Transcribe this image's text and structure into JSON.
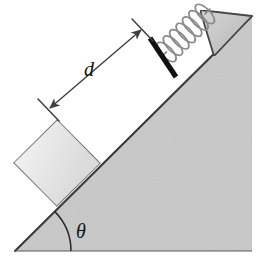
{
  "figure": {
    "type": "physics-diagram",
    "width": 269,
    "height": 268,
    "background_color": "#ffffff"
  },
  "labels": {
    "distance_label": "d",
    "angle_label": "θ"
  },
  "colors": {
    "incline_fill": "#c9c9c9",
    "incline_stroke": "#3a3a3a",
    "block_fill": "#e9e9e9",
    "block_stroke": "#555555",
    "wall_fill": "#c4c4c4",
    "wall_stroke": "#3a3a3a",
    "spring_stroke": "#7a7a7a",
    "plate_fill": "#111111",
    "dimension_stroke": "#3f3f3f",
    "arc_stroke": "#2a2a2a",
    "text_color": "#111111"
  },
  "elements": {
    "incline": {
      "name": "inclined-plane",
      "description": "Right triangle wedge, hypotenuse rising left to right",
      "apex_point": [
        15,
        251
      ],
      "top_right_point": [
        252,
        16
      ],
      "bottom_right_point": [
        252,
        251
      ]
    },
    "block": {
      "name": "block",
      "description": "Square block resting on the incline surface",
      "center": [
        57,
        163
      ],
      "size": 62
    },
    "spring": {
      "name": "spring",
      "description": "Coiled compression spring along the incline",
      "coils": 7,
      "start": [
        172,
        62
      ],
      "end": [
        224,
        24
      ]
    },
    "plate": {
      "name": "spring-end-plate",
      "description": "Thick black bar perpendicular to incline at the free end of the spring",
      "from": [
        149,
        38
      ],
      "to": [
        176,
        76
      ]
    },
    "wall": {
      "name": "spring-anchor-wall",
      "description": "Narrow triangular flange at the top of the incline anchoring the spring",
      "tip": [
        200,
        10
      ],
      "base_outer": [
        252,
        16
      ],
      "base_inner": [
        215,
        55
      ]
    },
    "dimension": {
      "name": "distance-dimension",
      "description": "Double-headed arrow measuring distance d along the incline",
      "from": [
        48,
        110
      ],
      "to": [
        142,
        30
      ],
      "tick_length": 22,
      "label_position": [
        91,
        66
      ]
    },
    "angle": {
      "name": "incline-angle",
      "description": "Arc at the base vertex indicating the incline angle theta",
      "vertex": [
        15,
        251
      ],
      "radius": 56,
      "label_position": [
        76,
        232
      ]
    }
  }
}
